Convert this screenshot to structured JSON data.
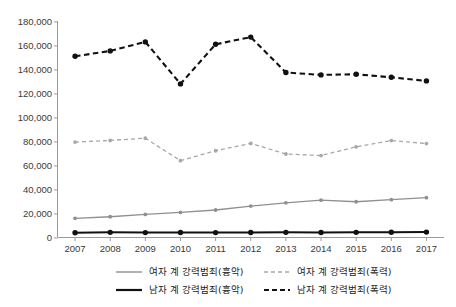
{
  "chart_data": {
    "type": "line",
    "title": "",
    "xlabel": "",
    "ylabel": "",
    "categories": [
      "2007",
      "2008",
      "2009",
      "2010",
      "2011",
      "2012",
      "2013",
      "2014",
      "2015",
      "2016",
      "2017"
    ],
    "ylim": [
      0,
      180000
    ],
    "ytick_values": [
      0,
      20000,
      40000,
      60000,
      80000,
      100000,
      120000,
      140000,
      160000,
      180000
    ],
    "ytick_labels": [
      "0",
      "20,000",
      "40,000",
      "60,000",
      "80,000",
      "100,000",
      "120,000",
      "140,000",
      "160,000",
      "180,000"
    ],
    "grid": false,
    "legend_position": "bottom",
    "series": [
      {
        "name": "여자 계 강력범죄(흉악)",
        "key": "female_heinous",
        "color": "#909090",
        "style": "solid",
        "marker": "circle",
        "values": [
          16000,
          17300,
          19200,
          20900,
          22900,
          26200,
          28900,
          31100,
          29800,
          31500,
          33200
        ]
      },
      {
        "name": "여자 계 강력범죄(폭력)",
        "key": "female_violence",
        "color": "#a8a8a8",
        "style": "dashed",
        "marker": "circle",
        "values": [
          79500,
          80900,
          82700,
          64000,
          72300,
          78400,
          69600,
          68300,
          75600,
          80800,
          78300
        ]
      },
      {
        "name": "남자 계 강력범죄(흉악)",
        "key": "male_heinous",
        "color": "#111111",
        "style": "solid",
        "marker": "circle",
        "values": [
          4000,
          4300,
          4100,
          4200,
          4100,
          4200,
          4300,
          4200,
          4300,
          4400,
          4500
        ]
      },
      {
        "name": "남자 계 강력범죄(폭력)",
        "key": "male_violence",
        "color": "#111111",
        "style": "dashed",
        "marker": "circle",
        "values": [
          151000,
          155500,
          163000,
          128000,
          161000,
          167000,
          137500,
          135500,
          136000,
          133500,
          130500
        ]
      }
    ]
  }
}
